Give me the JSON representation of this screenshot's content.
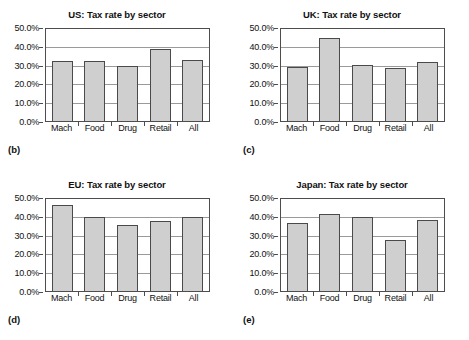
{
  "figure": {
    "background": "#ffffff",
    "bar_fill": "#cfcfcf",
    "bar_stroke": "#4a4a4a",
    "grid_color": "#9a9a9a",
    "axis_color": "#4d4d4d"
  },
  "y_axis": {
    "ticks": [
      "0.0%",
      "10.0%",
      "20.0%",
      "30.0%",
      "40.0%",
      "50.0%"
    ],
    "min": 0,
    "max": 50
  },
  "panels": [
    {
      "id": "us",
      "label": "(b)",
      "title": "US: Tax rate by sector",
      "chart_data": {
        "type": "bar",
        "title": "US: Tax rate by sector",
        "xlabel": "",
        "ylabel": "",
        "ylim": [
          0,
          50
        ],
        "grid": true,
        "legend": false,
        "categories": [
          "Mach",
          "Food",
          "Drug",
          "Retail",
          "All"
        ],
        "values": [
          32.0,
          32.0,
          29.0,
          38.5,
          32.5
        ],
        "tick_labels": [
          "0.0%",
          "10.0%",
          "20.0%",
          "30.0%",
          "40.0%",
          "50.0%"
        ]
      }
    },
    {
      "id": "uk",
      "label": "(c)",
      "title": "UK: Tax rate by sector",
      "chart_data": {
        "type": "bar",
        "title": "UK: Tax rate by sector",
        "xlabel": "",
        "ylabel": "",
        "ylim": [
          0,
          50
        ],
        "grid": true,
        "legend": false,
        "categories": [
          "Mach",
          "Food",
          "Drug",
          "Retail",
          "All"
        ],
        "values": [
          28.5,
          44.0,
          30.0,
          28.0,
          31.5
        ],
        "tick_labels": [
          "0.0%",
          "10.0%",
          "20.0%",
          "30.0%",
          "40.0%",
          "50.0%"
        ]
      }
    },
    {
      "id": "eu",
      "label": "(d)",
      "title": "EU: Tax rate by sector",
      "chart_data": {
        "type": "bar",
        "title": "EU: Tax rate by sector",
        "xlabel": "",
        "ylabel": "",
        "ylim": [
          0,
          50
        ],
        "grid": true,
        "legend": false,
        "categories": [
          "Mach",
          "Food",
          "Drug",
          "Retail",
          "All"
        ],
        "values": [
          46.0,
          39.5,
          35.0,
          37.0,
          39.5
        ],
        "tick_labels": [
          "0.0%",
          "10.0%",
          "20.0%",
          "30.0%",
          "40.0%",
          "50.0%"
        ]
      }
    },
    {
      "id": "japan",
      "label": "(e)",
      "title": "Japan: Tax rate by sector",
      "chart_data": {
        "type": "bar",
        "title": "Japan: Tax rate by sector",
        "xlabel": "",
        "ylabel": "",
        "ylim": [
          0,
          50
        ],
        "grid": true,
        "legend": false,
        "categories": [
          "Mach",
          "Food",
          "Drug",
          "Retail",
          "All"
        ],
        "values": [
          36.0,
          41.0,
          39.5,
          27.0,
          38.0
        ],
        "tick_labels": [
          "0.0%",
          "10.0%",
          "20.0%",
          "30.0%",
          "40.0%",
          "50.0%"
        ]
      }
    }
  ]
}
